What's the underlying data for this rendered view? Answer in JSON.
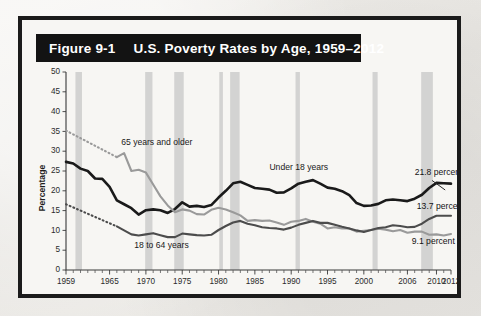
{
  "figure": {
    "number_label": "Figure 9-1",
    "title": "U.S. Poverty Rates by Age, 1959–2012"
  },
  "legend": {
    "position": "top-right",
    "entries": [
      {
        "label": "Recession",
        "swatch_color": "#bdbdbd",
        "icon": "square-swatch-icon"
      }
    ]
  },
  "chart_data": {
    "type": "line",
    "title": "U.S. Poverty Rates by Age, 1959–2012",
    "xlabel": "",
    "ylabel": "Percentage",
    "xlim": [
      1959,
      2012
    ],
    "ylim": [
      0,
      50
    ],
    "ytick_step": 5,
    "grid": false,
    "yticks": [
      0,
      5,
      10,
      15,
      20,
      25,
      30,
      35,
      40,
      45,
      50
    ],
    "xticks": [
      1959,
      1965,
      1970,
      1975,
      1980,
      1985,
      1990,
      1995,
      2000,
      2006,
      2010,
      2012
    ],
    "x_minor_tick_every": 1,
    "legend_position": "upper right",
    "series": [
      {
        "name": "Under 18 years",
        "color": "#1a1a1a",
        "stroke_width": 2.6,
        "style": "solid",
        "label_text": "Under 18 years",
        "end_value_label": "21.8 percent",
        "end_value": 21.8,
        "x": [
          1959,
          1960,
          1961,
          1962,
          1963,
          1964,
          1965,
          1966,
          1967,
          1968,
          1969,
          1970,
          1971,
          1972,
          1973,
          1974,
          1975,
          1976,
          1977,
          1978,
          1979,
          1980,
          1981,
          1982,
          1983,
          1984,
          1985,
          1986,
          1987,
          1988,
          1989,
          1990,
          1991,
          1992,
          1993,
          1994,
          1995,
          1996,
          1997,
          1998,
          1999,
          2000,
          2001,
          2002,
          2003,
          2004,
          2005,
          2006,
          2007,
          2008,
          2009,
          2010,
          2011,
          2012
        ],
        "y": [
          27.3,
          26.9,
          25.6,
          25.0,
          23.1,
          23.0,
          21.0,
          17.6,
          16.6,
          15.6,
          14.0,
          15.1,
          15.3,
          15.1,
          14.4,
          15.4,
          17.1,
          16.0,
          16.2,
          15.9,
          16.4,
          18.3,
          20.0,
          21.9,
          22.3,
          21.5,
          20.7,
          20.5,
          20.3,
          19.5,
          19.6,
          20.6,
          21.8,
          22.3,
          22.7,
          21.8,
          20.8,
          20.5,
          19.9,
          18.9,
          16.9,
          16.2,
          16.3,
          16.7,
          17.6,
          17.8,
          17.6,
          17.4,
          18.0,
          19.0,
          20.7,
          22.0,
          21.9,
          21.8
        ]
      },
      {
        "name": "65 years and older",
        "color": "#9a9a9a",
        "stroke_width": 2.1,
        "style": "solid-with-dotted-extension",
        "label_text": "65 years and older",
        "end_value_label": "9.1 percent",
        "end_value": 9.1,
        "dotted_segment": {
          "x": [
            1959,
            1966
          ],
          "y": [
            35.2,
            28.5
          ]
        },
        "x": [
          1966,
          1967,
          1968,
          1969,
          1970,
          1971,
          1972,
          1973,
          1974,
          1975,
          1976,
          1977,
          1978,
          1979,
          1980,
          1981,
          1982,
          1983,
          1984,
          1985,
          1986,
          1987,
          1988,
          1989,
          1990,
          1991,
          1992,
          1993,
          1994,
          1995,
          1996,
          1997,
          1998,
          1999,
          2000,
          2001,
          2002,
          2003,
          2004,
          2005,
          2006,
          2007,
          2008,
          2009,
          2010,
          2011,
          2012
        ],
        "y": [
          28.5,
          29.5,
          25.0,
          25.3,
          24.6,
          21.6,
          18.6,
          16.3,
          14.6,
          15.3,
          15.0,
          14.1,
          14.0,
          15.2,
          15.7,
          15.3,
          14.6,
          13.8,
          12.4,
          12.6,
          12.4,
          12.5,
          12.0,
          11.4,
          12.2,
          12.4,
          12.9,
          12.2,
          11.7,
          10.5,
          10.8,
          10.5,
          10.5,
          9.7,
          9.9,
          10.1,
          10.4,
          10.2,
          9.8,
          10.1,
          9.4,
          9.7,
          9.7,
          8.9,
          9.0,
          8.7,
          9.1
        ]
      },
      {
        "name": "18 to 64 years",
        "color": "#4c4c4c",
        "stroke_width": 2.1,
        "style": "solid-with-dotted-extension",
        "label_text": "18 to 64 years",
        "end_value_label": "13.7 percent",
        "end_value": 13.7,
        "dotted_segment": {
          "x": [
            1959,
            1966
          ],
          "y": [
            16.6,
            11.0
          ]
        },
        "x": [
          1966,
          1967,
          1968,
          1969,
          1970,
          1971,
          1972,
          1973,
          1974,
          1975,
          1976,
          1977,
          1978,
          1979,
          1980,
          1981,
          1982,
          1983,
          1984,
          1985,
          1986,
          1987,
          1988,
          1989,
          1990,
          1991,
          1992,
          1993,
          1994,
          1995,
          1996,
          1997,
          1998,
          1999,
          2000,
          2001,
          2002,
          2003,
          2004,
          2005,
          2006,
          2007,
          2008,
          2009,
          2010,
          2011,
          2012
        ],
        "y": [
          11.0,
          10.0,
          9.0,
          8.7,
          9.0,
          9.3,
          8.8,
          8.3,
          8.3,
          9.2,
          9.0,
          8.8,
          8.7,
          8.9,
          10.1,
          11.1,
          12.0,
          12.4,
          11.7,
          11.3,
          10.8,
          10.6,
          10.5,
          10.2,
          10.7,
          11.4,
          11.9,
          12.4,
          11.9,
          11.9,
          11.4,
          10.9,
          10.5,
          10.0,
          9.6,
          10.1,
          10.6,
          10.8,
          11.3,
          11.1,
          10.8,
          10.9,
          11.7,
          12.9,
          13.7,
          13.7,
          13.7
        ]
      }
    ],
    "recessions": [
      {
        "start": 1960.3,
        "end": 1961.2
      },
      {
        "start": 1969.9,
        "end": 1970.9
      },
      {
        "start": 1973.9,
        "end": 1975.2
      },
      {
        "start": 1980.1,
        "end": 1980.6
      },
      {
        "start": 1981.6,
        "end": 1982.9
      },
      {
        "start": 1990.6,
        "end": 1991.2
      },
      {
        "start": 2001.2,
        "end": 2001.9
      },
      {
        "start": 2007.9,
        "end": 2009.5
      }
    ],
    "annotations": [
      {
        "text": "65 years and older",
        "x": 1966.6,
        "y": 31.5
      },
      {
        "text": "Under 18 years",
        "x": 1987.0,
        "y": 25.2
      },
      {
        "text": "18 to 64 years",
        "x": 1968.4,
        "y": 5.6
      },
      {
        "text": "21.8 percent",
        "x": 2007.0,
        "y": 24.0
      },
      {
        "text": "13.7 percent",
        "x": 2007.3,
        "y": 15.3
      },
      {
        "text": "9.1 percent",
        "x": 2006.6,
        "y": 6.6
      }
    ]
  }
}
